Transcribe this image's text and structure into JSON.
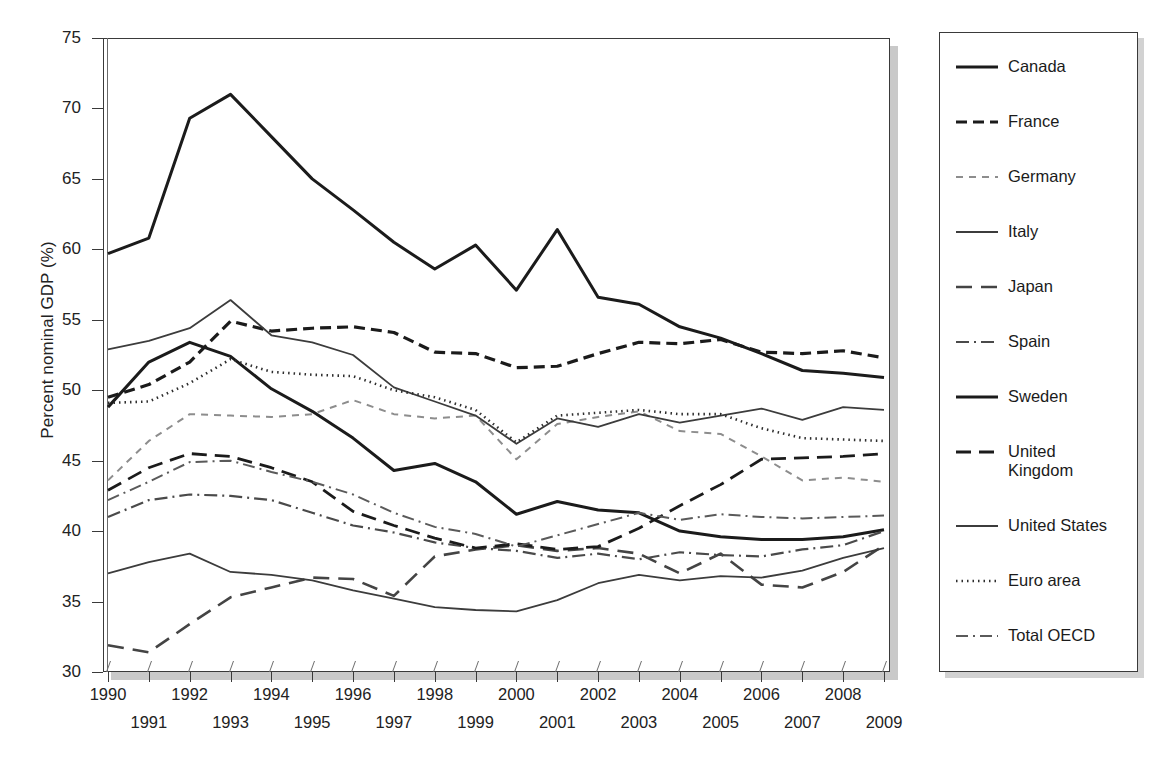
{
  "axes": {
    "ylabel": "Percent nominal GDP (%)",
    "yticks": [
      30,
      35,
      40,
      45,
      50,
      55,
      60,
      65,
      70,
      75
    ],
    "ylim": [
      30,
      75
    ],
    "xticks": [
      1990,
      1991,
      1992,
      1993,
      1994,
      1995,
      1996,
      1997,
      1998,
      1999,
      2000,
      2001,
      2002,
      2003,
      2004,
      2005,
      2006,
      2007,
      2008,
      2009
    ],
    "xlim": [
      1990,
      2009
    ],
    "grid": false
  },
  "legend": {
    "position": "right-outside",
    "entries": [
      {
        "label": "Canada",
        "style": "solid-thick"
      },
      {
        "label": "France",
        "style": "dashed-thick"
      },
      {
        "label": "Germany",
        "style": "dashed-light"
      },
      {
        "label": "Italy",
        "style": "solid-thin"
      },
      {
        "label": "Japan",
        "style": "longdash"
      },
      {
        "label": "Spain",
        "style": "dashdot"
      },
      {
        "label": "Sweden",
        "style": "solid-thick"
      },
      {
        "label": "United\nKingdom",
        "style": "longdash-thick"
      },
      {
        "label": "United States",
        "style": "solid-thin"
      },
      {
        "label": "Euro area",
        "style": "dotted"
      },
      {
        "label": "Total OECD",
        "style": "dashdot-thin"
      }
    ]
  },
  "chart_data": {
    "type": "line",
    "title": "",
    "xlabel": "",
    "ylabel": "Percent nominal GDP (%)",
    "xlim": [
      1990,
      2009
    ],
    "ylim": [
      30,
      75
    ],
    "x": [
      1990,
      1991,
      1992,
      1993,
      1994,
      1995,
      1996,
      1997,
      1998,
      1999,
      2000,
      2001,
      2002,
      2003,
      2004,
      2005,
      2006,
      2007,
      2008,
      2009
    ],
    "series": [
      {
        "name": "Canada",
        "style": "solid-thick",
        "values": [
          48.8,
          52.0,
          53.4,
          52.4,
          50.1,
          48.5,
          46.6,
          44.3,
          44.8,
          43.5,
          41.2,
          42.1,
          41.5,
          41.3,
          40.0,
          39.6,
          39.4,
          39.4,
          39.6,
          40.1
        ]
      },
      {
        "name": "France",
        "style": "dashed-thick",
        "values": [
          49.5,
          50.4,
          52.0,
          54.9,
          54.2,
          54.4,
          54.5,
          54.1,
          52.7,
          52.6,
          51.6,
          51.7,
          52.6,
          53.4,
          53.3,
          53.6,
          52.7,
          52.6,
          52.8,
          52.3
        ]
      },
      {
        "name": "Germany",
        "style": "dashed-light",
        "values": [
          43.6,
          46.4,
          48.3,
          48.2,
          48.1,
          48.3,
          49.3,
          48.3,
          48.0,
          48.2,
          45.1,
          47.6,
          48.1,
          48.5,
          47.1,
          46.9,
          45.3,
          43.6,
          43.8,
          43.5
        ]
      },
      {
        "name": "Italy",
        "style": "solid-thin",
        "values": [
          52.9,
          53.5,
          54.4,
          56.4,
          53.9,
          53.4,
          52.5,
          50.2,
          49.2,
          48.2,
          46.2,
          48.0,
          47.4,
          48.3,
          47.7,
          48.2,
          48.7,
          47.9,
          48.8,
          48.6
        ]
      },
      {
        "name": "Japan",
        "style": "longdash",
        "values": [
          31.9,
          31.4,
          33.4,
          35.3,
          36.0,
          36.7,
          36.6,
          35.4,
          38.2,
          38.7,
          39.0,
          38.6,
          38.8,
          38.4,
          37.0,
          38.4,
          36.2,
          36.0,
          37.1,
          39.0
        ]
      },
      {
        "name": "Spain",
        "style": "dashdot",
        "values": [
          41.0,
          42.2,
          42.6,
          42.5,
          42.2,
          41.3,
          40.4,
          39.9,
          39.2,
          38.8,
          38.6,
          38.1,
          38.4,
          38.0,
          38.5,
          38.3,
          38.2,
          38.7,
          39.0,
          40.0
        ]
      },
      {
        "name": "Sweden",
        "style": "solid-thick",
        "values": [
          59.7,
          60.8,
          69.3,
          71.0,
          68.0,
          65.0,
          62.8,
          60.5,
          58.6,
          60.3,
          57.1,
          61.4,
          56.6,
          56.1,
          54.5,
          53.7,
          52.6,
          51.4,
          51.2,
          50.9
        ]
      },
      {
        "name": "United Kingdom",
        "style": "longdash-thick",
        "values": [
          42.9,
          44.5,
          45.5,
          45.3,
          44.5,
          43.5,
          41.4,
          40.4,
          39.5,
          38.8,
          39.1,
          38.7,
          38.9,
          40.2,
          41.8,
          43.3,
          45.1,
          45.2,
          45.3,
          45.5
        ]
      },
      {
        "name": "United States",
        "style": "solid-thin",
        "values": [
          37.0,
          37.8,
          38.4,
          37.1,
          36.9,
          36.5,
          35.8,
          35.2,
          34.6,
          34.4,
          34.3,
          35.1,
          36.3,
          36.9,
          36.5,
          36.8,
          36.7,
          37.2,
          38.1,
          38.8
        ]
      },
      {
        "name": "Euro area",
        "style": "dotted",
        "values": [
          49.1,
          49.2,
          50.5,
          52.2,
          51.3,
          51.1,
          51.0,
          50.0,
          49.5,
          48.6,
          46.3,
          48.2,
          48.4,
          48.6,
          48.3,
          48.3,
          47.3,
          46.6,
          46.5,
          46.4
        ]
      },
      {
        "name": "Total OECD",
        "style": "dashdot-thin",
        "values": [
          42.2,
          43.5,
          44.9,
          45.0,
          44.2,
          43.5,
          42.6,
          41.3,
          40.3,
          39.8,
          38.9,
          39.7,
          40.5,
          41.3,
          40.8,
          41.2,
          41.0,
          40.9,
          41.0,
          41.1
        ]
      }
    ]
  }
}
